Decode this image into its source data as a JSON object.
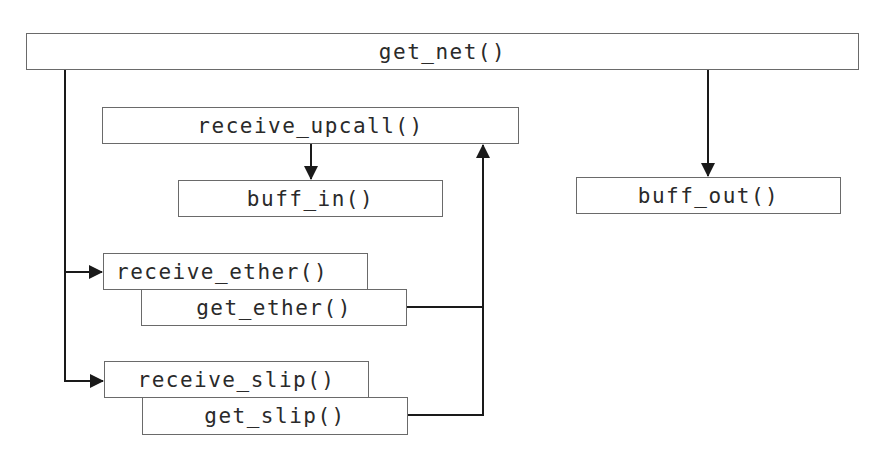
{
  "diagram": {
    "type": "call-graph",
    "nodes": {
      "get_net": {
        "label": "get_net()"
      },
      "receive_upcall": {
        "label": "receive_upcall()"
      },
      "buff_in": {
        "label": "buff_in()"
      },
      "buff_out": {
        "label": "buff_out()"
      },
      "receive_ether": {
        "label": "receive_ether()"
      },
      "get_ether": {
        "label": "get_ether()"
      },
      "receive_slip": {
        "label": "receive_slip()"
      },
      "get_slip": {
        "label": "get_slip()"
      }
    },
    "edges": [
      {
        "from": "get_net()",
        "to": "buff_out()"
      },
      {
        "from": "get_net()",
        "to": "receive_ether()"
      },
      {
        "from": "get_net()",
        "to": "receive_slip()"
      },
      {
        "from": "receive_upcall()",
        "to": "buff_in()"
      },
      {
        "from": "get_ether()",
        "to": "receive_upcall()"
      },
      {
        "from": "get_slip()",
        "to": "receive_upcall()"
      }
    ],
    "colors": {
      "line": "#1a1a1a",
      "border": "#6a6a6a",
      "text": "#2a2a2a",
      "background": "#ffffff"
    }
  }
}
